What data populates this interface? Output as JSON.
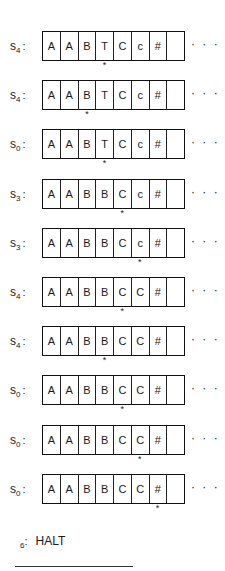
{
  "diagram": {
    "type": "turing-machine-trace",
    "continuation_glyph": "· · ·",
    "head_glyph": "*",
    "rows": [
      {
        "state": "s",
        "sub": "4",
        "tape": [
          "A",
          "A",
          "B",
          "T",
          "C",
          "c",
          "#",
          ""
        ],
        "head": 3
      },
      {
        "state": "s",
        "sub": "4",
        "tape": [
          "A",
          "A",
          "B",
          "T",
          "C",
          "c",
          "#",
          ""
        ],
        "head": 2
      },
      {
        "state": "s",
        "sub": "0",
        "tape": [
          "A",
          "A",
          "B",
          "T",
          "C",
          "c",
          "#",
          ""
        ],
        "head": 3
      },
      {
        "state": "s",
        "sub": "3",
        "tape": [
          "A",
          "A",
          "B",
          "B",
          "C",
          "c",
          "#",
          ""
        ],
        "head": 4
      },
      {
        "state": "s",
        "sub": "3",
        "tape": [
          "A",
          "A",
          "B",
          "B",
          "C",
          "c",
          "#",
          ""
        ],
        "head": 5
      },
      {
        "state": "s",
        "sub": "4",
        "tape": [
          "A",
          "A",
          "B",
          "B",
          "C",
          "C",
          "#",
          ""
        ],
        "head": 4
      },
      {
        "state": "s",
        "sub": "4",
        "tape": [
          "A",
          "A",
          "B",
          "B",
          "C",
          "C",
          "#",
          ""
        ],
        "head": 3
      },
      {
        "state": "s",
        "sub": "0",
        "tape": [
          "A",
          "A",
          "B",
          "B",
          "C",
          "C",
          "#",
          ""
        ],
        "head": 4
      },
      {
        "state": "s",
        "sub": "0",
        "tape": [
          "A",
          "A",
          "B",
          "B",
          "C",
          "C",
          "#",
          ""
        ],
        "head": 5
      },
      {
        "state": "s",
        "sub": "0",
        "tape": [
          "A",
          "A",
          "B",
          "B",
          "C",
          "C",
          "#",
          ""
        ],
        "head": 6
      }
    ],
    "final": {
      "label": "6",
      "text": "HALT"
    }
  }
}
